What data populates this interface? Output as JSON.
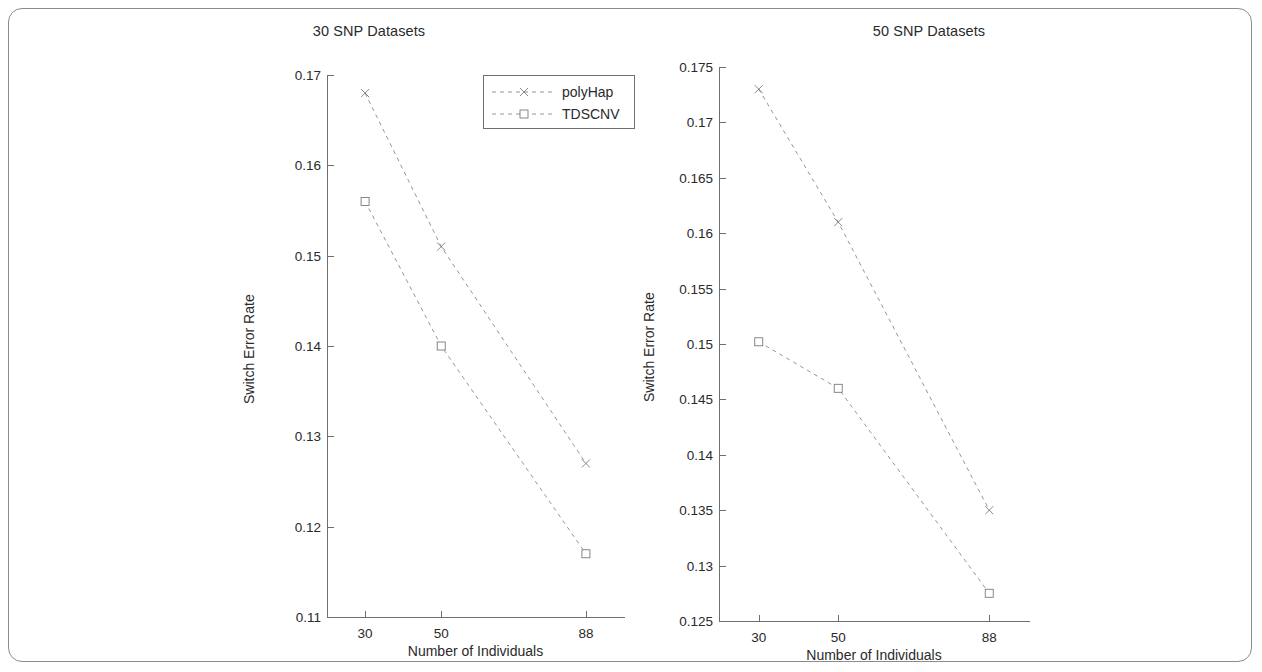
{
  "figure": {
    "border_color": "#8c8c8c",
    "line_color": "#8a8a8a",
    "axis_color": "#6f6f6f",
    "text_color": "#2a2a2a"
  },
  "legend": {
    "position": "top-right-of-left-panel",
    "entries": [
      {
        "label": "polyHap",
        "marker": "x",
        "linestyle": "dashed"
      },
      {
        "label": "TDSCNV",
        "marker": "square",
        "linestyle": "dashed"
      }
    ]
  },
  "chart_data": [
    {
      "type": "line",
      "title": "30 SNP Datasets",
      "xlabel": "Number of Individuals",
      "ylabel": "Switch Error Rate",
      "categories": [
        "30",
        "50",
        "88"
      ],
      "x": [
        30,
        50,
        88
      ],
      "xtick_labels": [
        "30",
        "50",
        "88"
      ],
      "ytick_labels": [
        "0.11",
        "0.12",
        "0.13",
        "0.14",
        "0.15",
        "0.16",
        "0.17"
      ],
      "yticks": [
        0.11,
        0.12,
        0.13,
        0.14,
        0.15,
        0.16,
        0.17
      ],
      "ylim": [
        0.11,
        0.17
      ],
      "xlim": [
        20,
        98
      ],
      "grid": false,
      "series": [
        {
          "name": "polyHap",
          "marker": "x",
          "linestyle": "dashed",
          "values": [
            0.168,
            0.151,
            0.127
          ]
        },
        {
          "name": "TDSCNV",
          "marker": "square",
          "linestyle": "dashed",
          "values": [
            0.156,
            0.14,
            0.117
          ]
        }
      ]
    },
    {
      "type": "line",
      "title": "50 SNP Datasets",
      "xlabel": "Number of Individuals",
      "ylabel": "Switch Error Rate",
      "categories": [
        "30",
        "50",
        "88"
      ],
      "x": [
        30,
        50,
        88
      ],
      "xtick_labels": [
        "30",
        "50",
        "88"
      ],
      "ytick_labels": [
        "0.125",
        "0.13",
        "0.135",
        "0.14",
        "0.145",
        "0.15",
        "0.155",
        "0.16",
        "0.165",
        "0.17",
        "0.175"
      ],
      "yticks": [
        0.125,
        0.13,
        0.135,
        0.14,
        0.145,
        0.15,
        0.155,
        0.16,
        0.165,
        0.17,
        0.175
      ],
      "ylim": [
        0.125,
        0.175
      ],
      "xlim": [
        20,
        98
      ],
      "grid": false,
      "series": [
        {
          "name": "polyHap",
          "marker": "x",
          "linestyle": "dashed",
          "values": [
            0.173,
            0.161,
            0.135
          ]
        },
        {
          "name": "TDSCNV",
          "marker": "square",
          "linestyle": "dashed",
          "values": [
            0.1502,
            0.146,
            0.1275
          ]
        }
      ]
    }
  ]
}
